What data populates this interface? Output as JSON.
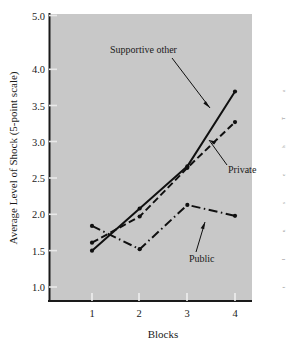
{
  "chart_data": {
    "type": "line",
    "title": "",
    "xlabel": "Blocks",
    "ylabel": "Average Level of Shock (5-point scale)",
    "categories": [
      "1",
      "2",
      "3",
      "4"
    ],
    "x": [
      1,
      2,
      3,
      4
    ],
    "xlim": [
      0.5,
      4.6
    ],
    "ylim": [
      0.72,
      5.0
    ],
    "yticks": [
      "5.0",
      "4.0",
      "3.5",
      "3.0",
      "2.5",
      "2.0",
      "1.5",
      "1.0"
    ],
    "ytick_values": [
      5.0,
      4.0,
      3.5,
      3.0,
      2.5,
      2.0,
      1.5,
      1.0
    ],
    "xticks": [
      "1",
      "2",
      "3",
      "4"
    ],
    "grid": false,
    "legend_position": "inline-annotations",
    "plot_background_color": "#c8c8c8",
    "line_color": "#101010",
    "series": [
      {
        "name": "Supportive other",
        "style": "solid",
        "values": [
          1.5,
          2.08,
          2.66,
          3.69
        ]
      },
      {
        "name": "Private",
        "style": "dashed",
        "values": [
          1.61,
          1.97,
          2.64,
          3.27
        ]
      },
      {
        "name": "Public",
        "style": "dash-dot",
        "values": [
          1.84,
          1.52,
          2.13,
          1.98
        ]
      }
    ],
    "annotations": [
      {
        "text": "Supportive other",
        "points_to_series": "Supportive other"
      },
      {
        "text": "Private",
        "points_to_series": "Private"
      },
      {
        "text": "Public",
        "points_to_series": "Public"
      }
    ]
  },
  "edge_fragments": {
    "f1": "a",
    "f2": "T",
    "f3": "h",
    "f4": "e",
    "f5": "s",
    "f6": "u",
    "f7": "l",
    "f8": "t"
  }
}
